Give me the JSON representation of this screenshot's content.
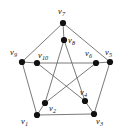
{
  "figure": {
    "kind": "petersen-graph-diagram",
    "width": 125,
    "height": 136,
    "background_color": "#ffffff",
    "edge_color": "#6b6b6b",
    "vertex_color": "#111111",
    "label_color": "#141414"
  },
  "chart_data": {
    "type": "diagram",
    "subtype": "undirected-graph",
    "title": "",
    "node_count": 10,
    "edge_count": 15,
    "nodes": [
      {
        "id": "v1",
        "label": "v",
        "sub": "1",
        "x": 37,
        "y": 115,
        "ring": "outer",
        "label_x": 21,
        "label_y": 117
      },
      {
        "id": "v2",
        "label": "v",
        "sub": "2",
        "x": 45,
        "y": 103,
        "ring": "inner",
        "label_x": 49,
        "label_y": 104
      },
      {
        "id": "v3",
        "label": "v",
        "sub": "3",
        "x": 94,
        "y": 114,
        "ring": "outer",
        "label_x": 96,
        "label_y": 117
      },
      {
        "id": "v4",
        "label": "v",
        "sub": "4",
        "x": 85,
        "y": 101,
        "ring": "inner",
        "label_x": 80,
        "label_y": 88
      },
      {
        "id": "v5",
        "label": "v",
        "sub": "5",
        "x": 110,
        "y": 62,
        "ring": "outer",
        "label_x": 105,
        "label_y": 48
      },
      {
        "id": "v6",
        "label": "v",
        "sub": "6",
        "x": 96,
        "y": 63,
        "ring": "inner",
        "label_x": 85,
        "label_y": 49
      },
      {
        "id": "v7",
        "label": "v",
        "sub": "7",
        "x": 63,
        "y": 23,
        "ring": "outer",
        "label_x": 58,
        "label_y": 7
      },
      {
        "id": "v8",
        "label": "v",
        "sub": "8",
        "x": 64,
        "y": 40,
        "ring": "inner",
        "label_x": 68,
        "label_y": 36
      },
      {
        "id": "v9",
        "label": "v",
        "sub": "9",
        "x": 22,
        "y": 62,
        "ring": "outer",
        "label_x": 10,
        "label_y": 48
      },
      {
        "id": "v10",
        "label": "v",
        "sub": "10",
        "x": 37,
        "y": 63,
        "ring": "inner",
        "label_x": 38,
        "label_y": 51
      }
    ],
    "edges": [
      {
        "source": "v7",
        "target": "v9",
        "group": "outer-cycle"
      },
      {
        "source": "v9",
        "target": "v1",
        "group": "outer-cycle"
      },
      {
        "source": "v1",
        "target": "v3",
        "group": "outer-cycle"
      },
      {
        "source": "v3",
        "target": "v5",
        "group": "outer-cycle"
      },
      {
        "source": "v5",
        "target": "v7",
        "group": "outer-cycle"
      },
      {
        "source": "v7",
        "target": "v8",
        "group": "spoke"
      },
      {
        "source": "v9",
        "target": "v10",
        "group": "spoke"
      },
      {
        "source": "v1",
        "target": "v2",
        "group": "spoke"
      },
      {
        "source": "v3",
        "target": "v4",
        "group": "spoke"
      },
      {
        "source": "v5",
        "target": "v6",
        "group": "spoke"
      },
      {
        "source": "v8",
        "target": "v2",
        "group": "inner-pentagram"
      },
      {
        "source": "v8",
        "target": "v4",
        "group": "inner-pentagram"
      },
      {
        "source": "v2",
        "target": "v6",
        "group": "inner-pentagram"
      },
      {
        "source": "v4",
        "target": "v10",
        "group": "inner-pentagram"
      },
      {
        "source": "v6",
        "target": "v10",
        "group": "inner-pentagram"
      }
    ]
  }
}
